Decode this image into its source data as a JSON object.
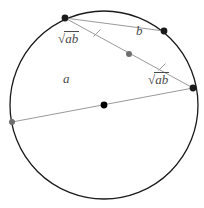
{
  "figure": {
    "background_color": "#ffffff",
    "circle": {
      "center_x": 104,
      "center_y": 105,
      "radius": 94,
      "stroke_color": "#1a1a1a",
      "stroke_width": 1.3,
      "fill": "none"
    },
    "center_point": {
      "name": "circle-center",
      "x": 104,
      "y": 105,
      "radius": 3.4,
      "color": "#000000"
    },
    "chords": [
      {
        "id": "chord-a",
        "label": "a",
        "x1": 12,
        "y1": 122,
        "x2": 193,
        "y2": 88,
        "stroke_color": "#9a9a9a",
        "stroke_width": 1.0
      },
      {
        "id": "chord-b",
        "label": "b",
        "x1": 65,
        "y1": 18,
        "x2": 193,
        "y2": 88,
        "stroke_color": "#9a9a9a",
        "stroke_width": 1.0
      },
      {
        "id": "chord-secondary",
        "label": "",
        "x1": 65,
        "y1": 18,
        "x2": 164,
        "y2": 31,
        "stroke_color": "#9a9a9a",
        "stroke_width": 1.0
      }
    ],
    "segments": [
      {
        "id": "segment-upper-left",
        "label": "sqrt(ab)",
        "from": "point-top-left",
        "to": "point-intersection"
      },
      {
        "id": "segment-upper-right",
        "label": "b",
        "from": "point-intersection",
        "to": "point-upper-right"
      },
      {
        "id": "segment-lower-left",
        "label": "a",
        "from": "point-left",
        "to": "point-intersection"
      },
      {
        "id": "segment-lower-right",
        "label": "sqrt(ab)",
        "from": "point-intersection",
        "to": "point-right"
      }
    ],
    "points": [
      {
        "name": "point-top-left",
        "x": 65,
        "y": 18,
        "radius": 3.4,
        "color": "#1a1a1a",
        "on": "circle"
      },
      {
        "name": "point-upper-right",
        "x": 164,
        "y": 31,
        "radius": 3.4,
        "color": "#1a1a1a",
        "on": "circle"
      },
      {
        "name": "point-right",
        "x": 193,
        "y": 88,
        "radius": 3.4,
        "color": "#1a1a1a",
        "on": "circle"
      },
      {
        "name": "point-left",
        "x": 12,
        "y": 122,
        "radius": 3.0,
        "color": "#6e6e6e",
        "on": "circle"
      },
      {
        "name": "point-intersection",
        "x": 129,
        "y": 54,
        "radius": 3.0,
        "color": "#6e6e6e",
        "on": "chord-crossing"
      }
    ],
    "tick_marks": [
      {
        "name": "tick-upper-left-segment",
        "x": 97,
        "y": 33,
        "angle_deg": 25,
        "length": 7,
        "color": "#9a9a9a"
      },
      {
        "name": "tick-lower-right-segment",
        "x": 162,
        "y": 67,
        "angle_deg": 25,
        "length": 7,
        "color": "#9a9a9a"
      }
    ],
    "labels": {
      "sqrt_ab_upper": {
        "radical": "√",
        "radicand": "ab",
        "x": 58,
        "y": 31
      },
      "sqrt_ab_lower": {
        "radical": "√",
        "radicand": "ab",
        "x": 148,
        "y": 72
      },
      "a": {
        "text": "a",
        "x": 63,
        "y": 72
      },
      "b": {
        "text": "b",
        "x": 136,
        "y": 24
      }
    },
    "colors": {
      "circle_stroke": "#1a1a1a",
      "chord_stroke": "#9a9a9a",
      "label_text": "#4a4a4a",
      "point_dark": "#1a1a1a",
      "point_grey": "#6e6e6e"
    }
  }
}
